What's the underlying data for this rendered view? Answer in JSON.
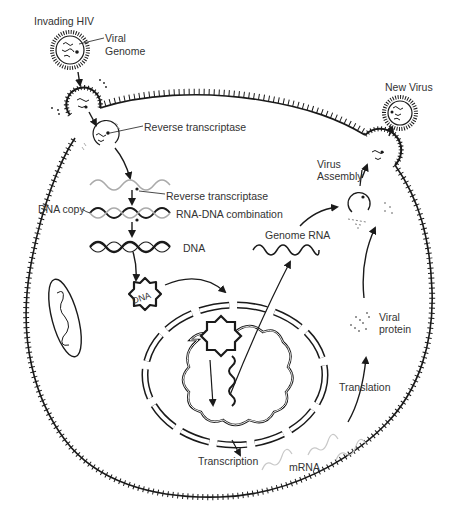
{
  "diagram": {
    "type": "HIV replication cycle",
    "colors": {
      "line": "#1a1a1a",
      "text": "#333333",
      "faint": "#bbbbbb",
      "background": "#ffffff"
    },
    "labels": {
      "invading_hiv": "Invading HIV",
      "viral": "Viral",
      "genome": "Genome",
      "reverse_transcriptase_1": "Reverse transcriptase",
      "reverse_transcriptase_2": "Reverse transcriptase",
      "dna_copy": "DNA copy",
      "rna_dna_combination": "RNA-DNA combination",
      "dna": "DNA",
      "dna_circle": "DNA",
      "genome_rna": "Genome RNA",
      "new_virus": "New Virus",
      "virus": "Virus",
      "assembly": "Assembly",
      "viral_2": "Viral",
      "protein": "protein",
      "translation": "Translation",
      "transcription": "Transcription",
      "mrna": "mRNA"
    },
    "steps": [
      "Invading HIV",
      "Reverse transcriptase",
      "RNA-DNA combination",
      "DNA",
      "Transcription",
      "mRNA",
      "Translation",
      "Viral protein",
      "Genome RNA",
      "Virus Assembly",
      "New Virus"
    ]
  }
}
